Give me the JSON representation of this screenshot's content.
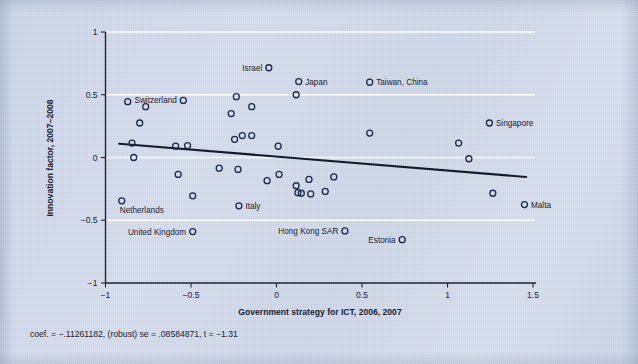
{
  "figure": {
    "xlabel": "Government strategy for ICT, 2006, 2007",
    "ylabel": "Innovation factor, 2007–2008",
    "caption": "coef. = −.11261182, (robust) se = .08584871, t = −1.31",
    "background_color": "#cdd7e8",
    "marker_color": "#1b2a4a",
    "grid_color": "#ffffff",
    "fitline_color": "#141c2c"
  },
  "chart_data": {
    "type": "scatter",
    "title": "",
    "xlabel": "Government strategy for ICT, 2006, 2007",
    "ylabel": "Innovation factor, 2007–2008",
    "xlim": [
      -1,
      1.5
    ],
    "ylim": [
      -1,
      1
    ],
    "xticks": [
      -1,
      -0.5,
      0,
      0.5,
      1,
      1.5
    ],
    "xticklabels": [
      "−1",
      "−0.5",
      "0",
      "0.5",
      "1",
      "1.5"
    ],
    "yticks": [
      -1,
      -0.5,
      0,
      0.5,
      1
    ],
    "yticklabels": [
      "−1",
      "−0.5",
      "0",
      "0.5",
      "1"
    ],
    "grid": "horizontal",
    "legend": "none",
    "fit_line": {
      "type": "linear-robust",
      "coef": -0.11261182,
      "se": 0.08584871,
      "t": -1.31,
      "x_start": -0.92,
      "y_start": 0.11,
      "x_end": 1.46,
      "y_end": -0.155
    },
    "points": [
      {
        "label": "",
        "x": -0.905,
        "y": -0.345
      },
      {
        "label": "",
        "x": -0.87,
        "y": 0.445
      },
      {
        "label": "",
        "x": -0.845,
        "y": 0.115
      },
      {
        "label": "",
        "x": -0.835,
        "y": 0.0
      },
      {
        "label": "",
        "x": -0.765,
        "y": 0.405
      },
      {
        "label": "",
        "x": -0.8,
        "y": 0.275
      },
      {
        "label": "Switzerland",
        "x": -0.545,
        "y": 0.455,
        "label_pos": "left"
      },
      {
        "label": "",
        "x": -0.59,
        "y": 0.09
      },
      {
        "label": "",
        "x": -0.52,
        "y": 0.095
      },
      {
        "label": "",
        "x": -0.575,
        "y": -0.135
      },
      {
        "label": "",
        "x": -0.49,
        "y": -0.305
      },
      {
        "label": "",
        "x": -0.335,
        "y": -0.085
      },
      {
        "label": "",
        "x": -0.265,
        "y": 0.35
      },
      {
        "label": "",
        "x": -0.245,
        "y": 0.145
      },
      {
        "label": "",
        "x": -0.235,
        "y": 0.485
      },
      {
        "label": "",
        "x": -0.2,
        "y": 0.175
      },
      {
        "label": "",
        "x": -0.225,
        "y": -0.095
      },
      {
        "label": "Italy",
        "x": -0.22,
        "y": -0.385,
        "label_pos": "right"
      },
      {
        "label": "",
        "x": -0.145,
        "y": 0.175
      },
      {
        "label": "",
        "x": -0.145,
        "y": 0.405
      },
      {
        "label": "Israel",
        "x": -0.045,
        "y": 0.715,
        "label_pos": "left"
      },
      {
        "label": "",
        "x": -0.055,
        "y": -0.185
      },
      {
        "label": "",
        "x": 0.01,
        "y": 0.09
      },
      {
        "label": "",
        "x": 0.015,
        "y": -0.135
      },
      {
        "label": "",
        "x": 0.115,
        "y": 0.5
      },
      {
        "label": "Japan",
        "x": 0.13,
        "y": 0.605,
        "label_pos": "right"
      },
      {
        "label": "",
        "x": 0.115,
        "y": -0.225
      },
      {
        "label": "",
        "x": 0.125,
        "y": -0.28
      },
      {
        "label": "",
        "x": 0.145,
        "y": -0.285
      },
      {
        "label": "",
        "x": 0.19,
        "y": -0.175
      },
      {
        "label": "",
        "x": 0.2,
        "y": -0.29
      },
      {
        "label": "",
        "x": 0.285,
        "y": -0.27
      },
      {
        "label": "",
        "x": 0.335,
        "y": -0.155
      },
      {
        "label": "Hong Kong SAR",
        "x": 0.4,
        "y": -0.585,
        "label_pos": "left"
      },
      {
        "label": "",
        "x": 0.545,
        "y": 0.195
      },
      {
        "label": "Taiwan, China",
        "x": 0.545,
        "y": 0.6,
        "label_pos": "right"
      },
      {
        "label": "Estonia",
        "x": 0.735,
        "y": -0.655,
        "label_pos": "left"
      },
      {
        "label": "",
        "x": 1.065,
        "y": 0.115
      },
      {
        "label": "",
        "x": 1.125,
        "y": -0.01
      },
      {
        "label": "Singapore",
        "x": 1.245,
        "y": 0.275,
        "label_pos": "right"
      },
      {
        "label": "",
        "x": 1.265,
        "y": -0.285
      },
      {
        "label": "Malta",
        "x": 1.45,
        "y": -0.375,
        "label_pos": "right"
      },
      {
        "label": "Netherlands",
        "x": -0.905,
        "y": -0.345,
        "label_only": true,
        "label_pos": "below"
      },
      {
        "label": "United Kingdom",
        "x": -0.49,
        "y": -0.59,
        "label_pos": "left"
      }
    ]
  }
}
